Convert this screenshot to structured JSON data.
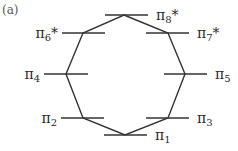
{
  "panel_label": "(a)",
  "diagram": {
    "type": "molecular-orbital-energy-diagram",
    "shape": "octagon",
    "line_color": "#333333",
    "levels": [
      {
        "id": "pi8",
        "symbol": "π",
        "sub": "8",
        "star": "*",
        "label": "π8*",
        "y": 15,
        "x1": 105,
        "x2": 148,
        "vx": 124,
        "label_side": "right"
      },
      {
        "id": "pi6",
        "symbol": "π",
        "sub": "6",
        "star": "*",
        "label": "π6*",
        "y": 33,
        "x1": 62,
        "x2": 105,
        "vx": 83,
        "label_side": "left"
      },
      {
        "id": "pi7",
        "symbol": "π",
        "sub": "7",
        "star": "*",
        "label": "π7*",
        "y": 33,
        "x1": 146,
        "x2": 189,
        "vx": 168,
        "label_side": "right"
      },
      {
        "id": "pi4",
        "symbol": "π",
        "sub": "4",
        "star": "",
        "label": "π4",
        "y": 74,
        "x1": 44,
        "x2": 88,
        "vx": 66,
        "label_side": "left"
      },
      {
        "id": "pi5",
        "symbol": "π",
        "sub": "5",
        "star": "",
        "label": "π5",
        "y": 74,
        "x1": 164,
        "x2": 207,
        "vx": 185,
        "label_side": "right"
      },
      {
        "id": "pi2",
        "symbol": "π",
        "sub": "2",
        "star": "",
        "label": "π2",
        "y": 118,
        "x1": 61,
        "x2": 104,
        "vx": 83,
        "label_side": "left"
      },
      {
        "id": "pi3",
        "symbol": "π",
        "sub": "3",
        "star": "",
        "label": "π3",
        "y": 118,
        "x1": 146,
        "x2": 189,
        "vx": 168,
        "label_side": "right"
      },
      {
        "id": "pi1",
        "symbol": "π",
        "sub": "1",
        "star": "",
        "label": "π1",
        "y": 135,
        "x1": 104,
        "x2": 147,
        "vx": 125,
        "label_side": "right"
      }
    ],
    "octagon_order": [
      "pi8",
      "pi7",
      "pi5",
      "pi3",
      "pi1",
      "pi2",
      "pi4",
      "pi6"
    ]
  }
}
